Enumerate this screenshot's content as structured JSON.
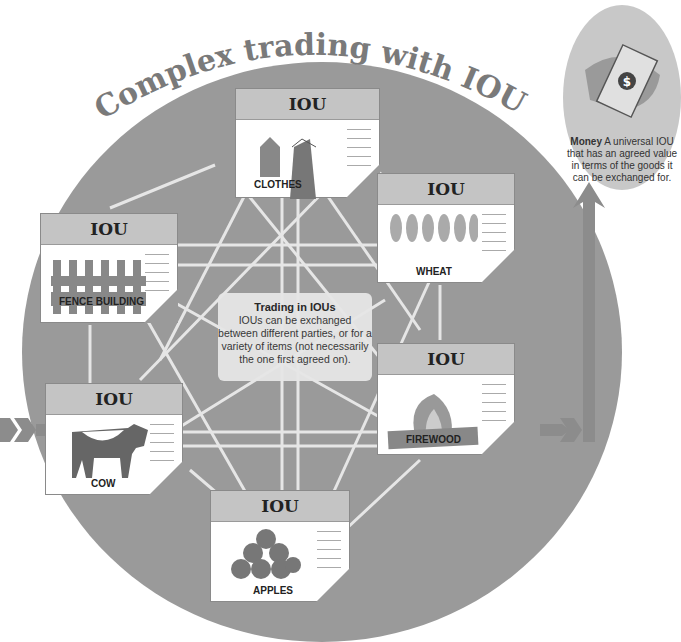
{
  "title": "Complex trading with IOUs",
  "cards": [
    {
      "id": "clothes",
      "header": "IOU",
      "label": "CLOTHES"
    },
    {
      "id": "wheat",
      "header": "IOU",
      "label": "WHEAT"
    },
    {
      "id": "fence",
      "header": "IOU",
      "label": "FENCE BUILDING"
    },
    {
      "id": "firewood",
      "header": "IOU",
      "label": "FIREWOOD"
    },
    {
      "id": "cow",
      "header": "IOU",
      "label": "COW"
    },
    {
      "id": "apples",
      "header": "IOU",
      "label": "APPLES"
    }
  ],
  "center": {
    "heading": "Trading in IOUs",
    "body": "IOUs can be exchanged between different parties, or for a variety of items (not necessarily the one first agreed on)."
  },
  "money": {
    "heading": "Money",
    "body": "A universal IOU that has an agreed value in terms of the goods it can be exchanged for.",
    "symbol": "$"
  },
  "colors": {
    "circle": "#9a9a9a",
    "card_header": "#c4c4c4",
    "arrow": "#8c8c8c",
    "line": "#f2f2f2"
  }
}
